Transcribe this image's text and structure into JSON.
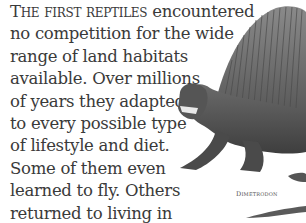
{
  "paragraph": {
    "lead": "The first reptiles",
    "lines": [
      " encountered",
      "no competition for the wide",
      "range of land habitats",
      "available. Over millions",
      "of years they adapted",
      "to every possible type",
      "of lifestyle and diet.",
      "Some of them even",
      "learned to fly. Others",
      "returned to living in",
      "the sea."
    ]
  },
  "illustration": {
    "subject": "dimetrodon-illustration",
    "caption": "Dimetrodon"
  },
  "colors": {
    "text": "#3a3a3a",
    "background": "#ffffff"
  }
}
